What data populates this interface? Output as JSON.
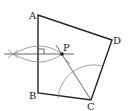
{
  "diagram": {
    "type": "geometry-construction",
    "points": {
      "A": {
        "label": "A",
        "x": 38,
        "y": 15
      },
      "B": {
        "label": "B",
        "x": 38,
        "y": 93
      },
      "C": {
        "label": "C",
        "x": 91,
        "y": 100
      },
      "D": {
        "label": "D",
        "x": 112,
        "y": 40
      },
      "P": {
        "label": "P",
        "x": 62,
        "y": 54
      }
    },
    "polygon": [
      "A",
      "B",
      "C",
      "D"
    ],
    "constructions": [
      "perpendicular bisector construction (lens arcs) crossing AB with right-angle mark",
      "angle bisector of angle BCD from C through P",
      "arc centered at C between CB and CD"
    ]
  }
}
